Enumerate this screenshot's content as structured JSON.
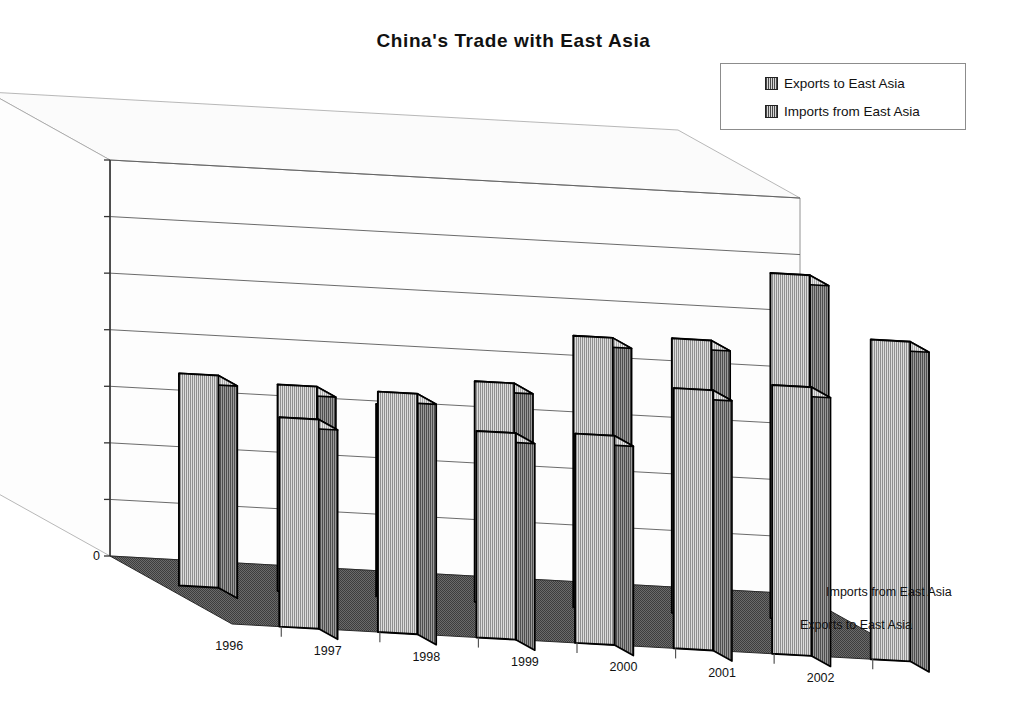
{
  "chart": {
    "title": "China's Trade with East Asia",
    "legend": {
      "position": "top-right",
      "items": [
        {
          "label": "Exports to East Asia",
          "swatch": "legend-swatch-icon"
        },
        {
          "label": "Imports from East Asia",
          "swatch": "legend-swatch-icon"
        }
      ]
    },
    "depth_axis_labels": [
      "Imports from East Asia",
      "Exports to East Asia"
    ]
  },
  "chart_data": {
    "type": "bar",
    "title": "China's Trade with East Asia",
    "xlabel": "",
    "ylabel": "",
    "ylim": [
      0,
      140000
    ],
    "ytick_labels": [
      "0",
      "20000",
      "40000",
      "60000",
      "80000",
      "100000",
      "120000",
      "140000"
    ],
    "yticks": [
      0,
      20000,
      40000,
      60000,
      80000,
      100000,
      120000,
      140000
    ],
    "grid": true,
    "three_d": true,
    "legend_position": "top-right",
    "categories": [
      "1996",
      "1997",
      "1998",
      "1999",
      "2000",
      "2001",
      "2002"
    ],
    "series": [
      {
        "name": "Exports to East Asia",
        "values": [
          74000,
          85000,
          73000,
          74000,
          92000,
          95000,
          113000
        ]
      },
      {
        "name": "Imports from East Asia",
        "values": [
          75000,
          73000,
          68000,
          78000,
          96000,
          97000,
          122000
        ]
      }
    ]
  },
  "colors": {
    "bar_face": "#a8a8a8",
    "bar_side": "#6f6f6f",
    "bar_top": "#cfcfcf",
    "bar_outline": "#000000",
    "floor": "#5d5d5d",
    "wall": "#fdfdfd",
    "gridline": "#5a5a5a",
    "axis": "#333333",
    "text": "#111111"
  }
}
